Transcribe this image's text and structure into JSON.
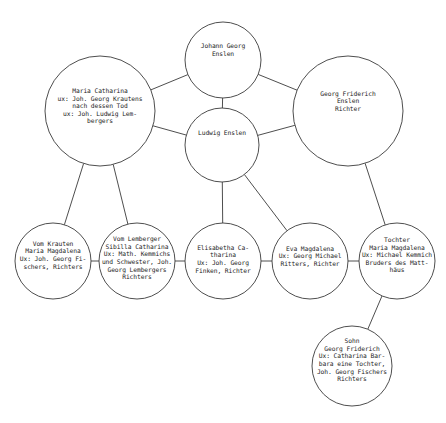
{
  "diagram": {
    "type": "family-tree",
    "stroke_color": "#3a3a3a",
    "background": "#ffffff",
    "nodes": [
      {
        "id": "johann",
        "cx": 223,
        "cy": 60,
        "r": 38,
        "text": "Johann Georg\nEnslen",
        "text_offset_y": -10
      },
      {
        "id": "ludwig",
        "cx": 222,
        "cy": 145,
        "r": 37,
        "text": "Ludwig Enslen",
        "text_offset_y": -12
      },
      {
        "id": "maria_catharina",
        "cx": 100,
        "cy": 111,
        "r": 55,
        "text": "Maria Catharina\nux: Joh. Georg Krautens\nnach dessen Tod\nux: Joh. Ludwig Lem-\nbergers",
        "text_offset_y": -5
      },
      {
        "id": "georg_friderich_senior",
        "cx": 348,
        "cy": 111,
        "r": 55,
        "text": "Georg Friderich\nEnslen\nRichter",
        "text_offset_y": -10
      },
      {
        "id": "vom_krauten",
        "cx": 53,
        "cy": 261,
        "r": 38,
        "text": "Vom Krauten\nMaria Magdalena\nUx: Joh. Georg Fi-\nschers, Richters",
        "text_offset_y": -6
      },
      {
        "id": "vom_lemberger",
        "cx": 137,
        "cy": 261,
        "r": 38,
        "text": "Vom Lemberger\nSibilla Catharina\nUx: Math. Kemmichs\nund Schwester, Joh.\nGeorg Lembergers\nRichters",
        "text_offset_y": -3
      },
      {
        "id": "elisabetha",
        "cx": 223,
        "cy": 261,
        "r": 38,
        "text": "Elisabetha Ca-\ntharina\nUx: Joh. Georg\nFinken, Richter",
        "text_offset_y": -2
      },
      {
        "id": "eva",
        "cx": 310,
        "cy": 261,
        "r": 38,
        "text": "Eva Magdalena\nUx: Georg Michael\nRitters, Richter",
        "text_offset_y": -5
      },
      {
        "id": "tochter",
        "cx": 397,
        "cy": 261,
        "r": 38,
        "text": "Tochter\nMaria Magdalena\nUx: Michael Kemmich\nBruders des Matt-\nhäus",
        "text_offset_y": -6
      },
      {
        "id": "sohn",
        "cx": 352,
        "cy": 366,
        "r": 40,
        "text": "Sohn\nGeorg Friderich\nUx: Catharina Bar-\nbara eine Tochter,\nJoh. Georg Fischers\nRichters",
        "text_offset_y": -6
      }
    ],
    "edges": [
      {
        "from": "johann",
        "to": "ludwig"
      },
      {
        "from": "johann",
        "to": "maria_catharina"
      },
      {
        "from": "johann",
        "to": "georg_friderich_senior"
      },
      {
        "from": "ludwig",
        "to": "maria_catharina"
      },
      {
        "from": "ludwig",
        "to": "georg_friderich_senior"
      },
      {
        "from": "maria_catharina",
        "to": "vom_krauten"
      },
      {
        "from": "maria_catharina",
        "to": "vom_lemberger"
      },
      {
        "from": "ludwig",
        "to": "elisabetha"
      },
      {
        "from": "ludwig",
        "to": "eva"
      },
      {
        "from": "georg_friderich_senior",
        "to": "tochter"
      },
      {
        "from": "vom_krauten",
        "to": "vom_lemberger"
      },
      {
        "from": "vom_lemberger",
        "to": "elisabetha"
      },
      {
        "from": "elisabetha",
        "to": "eva"
      },
      {
        "from": "eva",
        "to": "tochter"
      },
      {
        "from": "tochter",
        "to": "sohn"
      }
    ]
  }
}
